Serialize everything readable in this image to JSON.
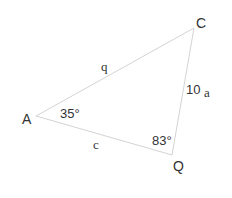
{
  "diagram": {
    "type": "triangle",
    "colors": {
      "line": "#d4d4d4",
      "text": "#333333",
      "background": "#ffffff"
    },
    "vertices": [
      {
        "id": "A",
        "label": "A",
        "x": 36,
        "y": 116
      },
      {
        "id": "C",
        "label": "C",
        "x": 194,
        "y": 28
      },
      {
        "id": "Q",
        "label": "Q",
        "x": 172,
        "y": 155
      }
    ],
    "sides": [
      {
        "id": "q",
        "from": "A",
        "to": "C",
        "label": "q"
      },
      {
        "id": "a",
        "from": "C",
        "to": "Q",
        "label": "a",
        "value": "10"
      },
      {
        "id": "c",
        "from": "A",
        "to": "Q",
        "label": "c"
      }
    ],
    "angles": [
      {
        "vertex": "A",
        "label": "35°"
      },
      {
        "vertex": "Q",
        "label": "83°"
      }
    ]
  }
}
